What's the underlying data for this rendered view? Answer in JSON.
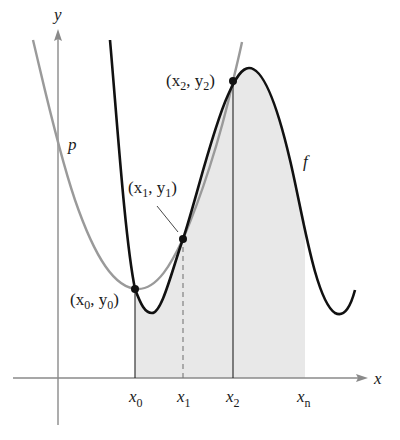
{
  "figure": {
    "type": "simpson-rule-illustration",
    "axes": {
      "x_label": "x",
      "y_label": "y",
      "axis_color": "#8a8a8a"
    },
    "curves": {
      "f": {
        "label": "f",
        "color": "#111111"
      },
      "p": {
        "label": "p",
        "color": "#9a9a9a"
      }
    },
    "shading": {
      "color": "#e6e6e6",
      "from": "x0",
      "to": "xn"
    },
    "points": [
      {
        "label_base": "(x",
        "sub_x": "0",
        "mid": ", y",
        "sub_y": "0",
        "close": ")"
      },
      {
        "label_base": "(x",
        "sub_x": "1",
        "mid": ", y",
        "sub_y": "1",
        "close": ")"
      },
      {
        "label_base": "(x",
        "sub_x": "2",
        "mid": ", y",
        "sub_y": "2",
        "close": ")"
      }
    ],
    "ticks": [
      {
        "base": "x",
        "sub": "0"
      },
      {
        "base": "x",
        "sub": "1"
      },
      {
        "base": "x",
        "sub": "2"
      },
      {
        "base": "x",
        "sub": "n"
      }
    ]
  }
}
